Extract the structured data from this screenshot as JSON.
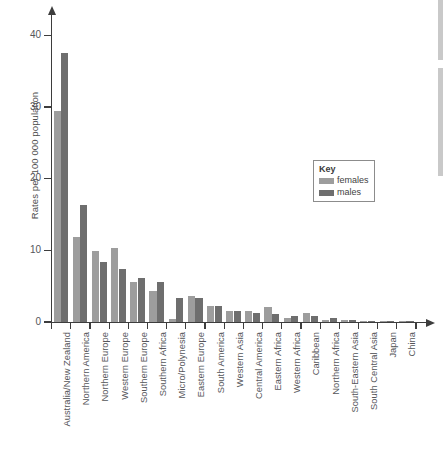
{
  "chart_data": {
    "type": "bar",
    "title": "",
    "subtitle": "",
    "xlabel": "",
    "ylabel": "Rates per 100 000 population",
    "ylim": [
      0,
      43
    ],
    "yticks": [
      0,
      10,
      20,
      30,
      40
    ],
    "ytick_labels": [
      "0",
      "10",
      "20",
      "30",
      "40"
    ],
    "grid": false,
    "legend": {
      "title": "Key",
      "position": "right-middle",
      "entries": [
        {
          "name": "females",
          "color": "#9d9d9d"
        },
        {
          "name": "males",
          "color": "#6e6e6e"
        }
      ]
    },
    "categories": [
      "Australia/New Zealand",
      "Northern America",
      "Northern Europe",
      "Western Europe",
      "Southern Europe",
      "Southern Africa",
      "Micro/Polynesia",
      "Eastern Europe",
      "South America",
      "Western Asia",
      "Central America",
      "Eastern Africa",
      "Western Africa",
      "Caribbean",
      "Northern Africa",
      "South-Eastern Asia",
      "South Central Asia",
      "Japan",
      "China"
    ],
    "series": [
      {
        "name": "females",
        "color": "#9d9d9d",
        "values": [
          29.4,
          11.8,
          9.9,
          10.3,
          5.6,
          4.3,
          0.4,
          3.7,
          2.3,
          1.5,
          1.5,
          2.1,
          0.6,
          1.2,
          0.3,
          0.3,
          0.2,
          0.2,
          0.15
        ]
      },
      {
        "name": "males",
        "color": "#6e6e6e",
        "values": [
          37.6,
          16.3,
          8.4,
          7.4,
          6.1,
          5.6,
          3.3,
          3.3,
          2.3,
          1.6,
          1.2,
          1.1,
          0.9,
          0.9,
          0.5,
          0.3,
          0.2,
          0.2,
          0.15
        ]
      }
    ]
  }
}
